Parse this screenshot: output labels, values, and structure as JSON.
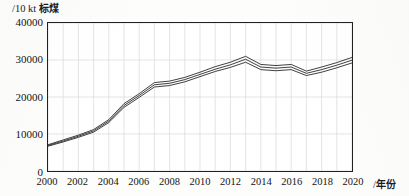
{
  "chart_data": {
    "type": "line",
    "title": "",
    "ylabel": "/10 kt 标煤",
    "xlabel": "/年份",
    "ylabel_prefix": "/10 kt ",
    "ylabel_cjk": "标煤",
    "xlabel_prefix": "/",
    "xlabel_cjk": "年份",
    "xlim": [
      2000,
      2020
    ],
    "ylim": [
      0,
      40000
    ],
    "grid": true,
    "grid_x_step": 1,
    "grid_y_step": 10000,
    "legend": "none",
    "ytick_labels": [
      "40000",
      "30000",
      "20000",
      "10000",
      "0"
    ],
    "ytick_values": [
      40000,
      30000,
      20000,
      10000,
      0
    ],
    "xtick_labels": [
      "2000",
      "2002",
      "2004",
      "2006",
      "2008",
      "2010",
      "2012",
      "2014",
      "2016",
      "2018",
      "2020"
    ],
    "xtick_values": [
      2000,
      2002,
      2004,
      2006,
      2008,
      2010,
      2012,
      2014,
      2016,
      2018,
      2020
    ],
    "x": [
      2000,
      2001,
      2002,
      2003,
      2004,
      2005,
      2006,
      2007,
      2008,
      2009,
      2010,
      2011,
      2012,
      2013,
      2014,
      2015,
      2016,
      2017,
      2018,
      2019,
      2020
    ],
    "series": [
      {
        "name": "upper",
        "values": [
          7100,
          8400,
          9700,
          11200,
          13900,
          18200,
          20900,
          23900,
          24300,
          25300,
          26700,
          28200,
          29400,
          31000,
          28800,
          28500,
          28800,
          27000,
          28100,
          29300,
          30700
        ]
      },
      {
        "name": "middle",
        "values": [
          6900,
          8100,
          9400,
          10850,
          13500,
          17700,
          20400,
          23300,
          23700,
          24700,
          26100,
          27500,
          28700,
          30200,
          28100,
          27800,
          28100,
          26400,
          27400,
          28600,
          29950
        ]
      },
      {
        "name": "lower",
        "values": [
          6700,
          7850,
          9100,
          10500,
          13100,
          17200,
          19900,
          22700,
          23100,
          24100,
          25500,
          26900,
          28000,
          29400,
          27400,
          27100,
          27400,
          25800,
          26700,
          27900,
          29200
        ]
      }
    ],
    "line_color": "#333333"
  },
  "axis": {
    "y_title_full": "/10 kt 标煤",
    "x_title_full": "/年份"
  }
}
